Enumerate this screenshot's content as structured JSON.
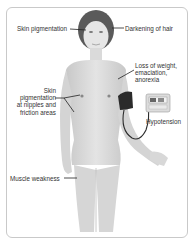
{
  "diagram": {
    "type": "anatomical-illustration",
    "labels": [
      {
        "id": "skin-pigmentation",
        "text": "Skin pigmentation"
      },
      {
        "id": "darkening-of-hair",
        "text": "Darkening of hair"
      },
      {
        "id": "loss-of-weight",
        "text": "Loss of weight,\nemaciation,\nanorexia"
      },
      {
        "id": "skin-pigmentation-nipples",
        "text": "Skin\npigmentation\nat nipples and\nfriction areas"
      },
      {
        "id": "hypotension",
        "text": "Hypotension"
      },
      {
        "id": "muscle-weakness",
        "text": "Muscle weakness"
      }
    ],
    "devices": [
      {
        "id": "bp-monitor",
        "icon": "blood-pressure-monitor-icon"
      }
    ],
    "colors": {
      "skin": "#d9d9d9",
      "hair": "#5a5a5a",
      "cuff": "#2b2b2b",
      "frame": "#c9c9c9",
      "text": "#333333"
    }
  }
}
